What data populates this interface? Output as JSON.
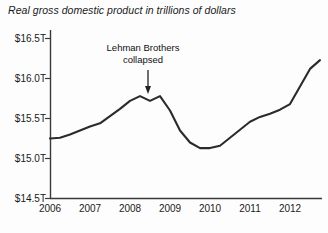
{
  "chart_data": {
    "type": "line",
    "title": "Real gross domestic product in trillions of dollars",
    "xlabel": "",
    "ylabel": "",
    "grid": false,
    "legend": "none",
    "xlim": [
      2006.0,
      2012.75
    ],
    "ylim": [
      14.5,
      16.5
    ],
    "yticks": [
      14.5,
      15.0,
      15.5,
      16.0,
      16.5
    ],
    "ytick_labels": [
      "$14.5T",
      "$15.0T",
      "$15.5T",
      "$16.0T",
      "$16.5T"
    ],
    "xticks": [
      2006,
      2007,
      2008,
      2009,
      2010,
      2011,
      2012
    ],
    "xtick_labels": [
      "2006",
      "2007",
      "2008",
      "2009",
      "2010",
      "2011",
      "2012"
    ],
    "series_name": "Real GDP",
    "line_color": "#2b2b2b",
    "x": [
      2006.0,
      2006.25,
      2006.5,
      2006.75,
      2007.0,
      2007.25,
      2007.5,
      2007.75,
      2008.0,
      2008.25,
      2008.5,
      2008.75,
      2009.0,
      2009.25,
      2009.5,
      2009.75,
      2010.0,
      2010.25,
      2010.5,
      2010.75,
      2011.0,
      2011.25,
      2011.5,
      2011.75,
      2012.0,
      2012.25,
      2012.5,
      2012.75
    ],
    "values": [
      15.25,
      15.26,
      15.3,
      15.35,
      15.4,
      15.44,
      15.53,
      15.62,
      15.72,
      15.78,
      15.72,
      15.78,
      15.6,
      15.35,
      15.2,
      15.13,
      15.13,
      15.16,
      15.26,
      15.36,
      15.46,
      15.52,
      15.56,
      15.61,
      15.68,
      15.9,
      16.12,
      16.23
    ],
    "annotations": [
      {
        "text_line_1": "Lehman Brothers",
        "text_line_2": "collapsed",
        "target_x": 2008.45,
        "target_y": 15.78,
        "arrow": "down"
      }
    ]
  },
  "annotation": {
    "line1": "Lehman Brothers",
    "line2": "collapsed"
  }
}
